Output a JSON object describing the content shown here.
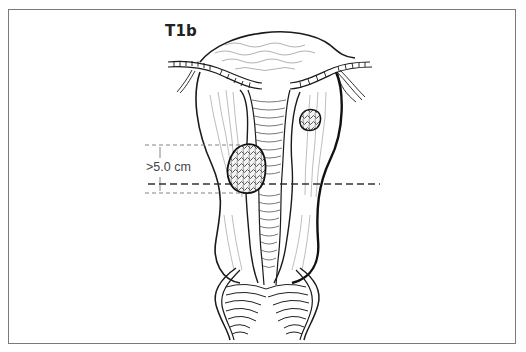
{
  "figure": {
    "stage_label": "T1b",
    "measurement_label": ">5.0 cm",
    "colors": {
      "frame": "#7a7a7a",
      "outline": "#1a1a1a",
      "texture": "#9a9a9a",
      "dashed_line": "#333333",
      "measure_line": "#777777"
    }
  }
}
